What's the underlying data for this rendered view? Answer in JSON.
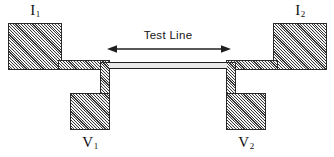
{
  "figure": {
    "width": 334,
    "height": 157,
    "background": "#ffffff",
    "line_color": "#1f1f1f",
    "hatch_fill": "#b9b9b9"
  },
  "annotation": {
    "test_line_label": "Test Line",
    "arrow_style": "double-headed",
    "arrow_x_start": 108,
    "arrow_x_end": 228,
    "arrow_y": 48
  },
  "labels": {
    "current_left": {
      "symbol": "I",
      "subscript": "1"
    },
    "current_right": {
      "symbol": "I",
      "subscript": "2"
    },
    "voltage_left": {
      "symbol": "V",
      "subscript": "1"
    },
    "voltage_right": {
      "symbol": "V",
      "subscript": "2"
    }
  },
  "geometry": {
    "pad_current_left": {
      "x": 8,
      "y": 23,
      "w": 54,
      "h": 47
    },
    "pad_current_right": {
      "x": 273,
      "y": 23,
      "w": 54,
      "h": 47
    },
    "pad_voltage_left": {
      "x": 70,
      "y": 93,
      "w": 40,
      "h": 37
    },
    "pad_voltage_right": {
      "x": 226,
      "y": 93,
      "w": 40,
      "h": 37
    },
    "bar_left": {
      "x": 58,
      "y": 60,
      "w": 52,
      "h": 10
    },
    "bar_right": {
      "x": 226,
      "y": 60,
      "w": 52,
      "h": 10
    },
    "stub_left": {
      "x": 100,
      "y": 62,
      "w": 10,
      "h": 34
    },
    "stub_right": {
      "x": 226,
      "y": 62,
      "w": 10,
      "h": 34
    },
    "test_line": {
      "x": 109,
      "y": 62,
      "w": 118,
      "h": 7
    }
  }
}
